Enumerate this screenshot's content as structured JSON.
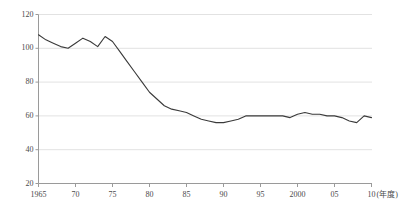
{
  "chart_data": {
    "type": "line",
    "title": "",
    "xlabel": "(年度)",
    "ylabel": "",
    "xlim": [
      1965,
      2010
    ],
    "ylim": [
      20,
      120
    ],
    "grid": true,
    "legend": false,
    "axis_color": "#9a9a9a",
    "grid_color": "#e2e2e2",
    "line_color": "#3a3a3a",
    "y_ticks": [
      {
        "value": 120,
        "label": "120"
      },
      {
        "value": 100,
        "label": "100"
      },
      {
        "value": 80,
        "label": "80"
      },
      {
        "value": 60,
        "label": "60"
      },
      {
        "value": 40,
        "label": "40"
      },
      {
        "value": 20,
        "label": "20"
      }
    ],
    "x_ticks": [
      {
        "value": 1965,
        "label": "1965"
      },
      {
        "value": 1970,
        "label": "70"
      },
      {
        "value": 1975,
        "label": "75"
      },
      {
        "value": 1980,
        "label": "80"
      },
      {
        "value": 1985,
        "label": "85"
      },
      {
        "value": 1990,
        "label": "90"
      },
      {
        "value": 1995,
        "label": "95"
      },
      {
        "value": 2000,
        "label": "2000"
      },
      {
        "value": 2005,
        "label": "05"
      },
      {
        "value": 2010,
        "label": "10"
      }
    ],
    "x_unit": "(年度)",
    "series": [
      {
        "name": "series-1",
        "x": [
          1965,
          1966,
          1967,
          1968,
          1969,
          1970,
          1971,
          1972,
          1973,
          1974,
          1975,
          1976,
          1977,
          1978,
          1979,
          1980,
          1981,
          1982,
          1983,
          1984,
          1985,
          1986,
          1987,
          1988,
          1989,
          1990,
          1991,
          1992,
          1993,
          1994,
          1995,
          1996,
          1997,
          1998,
          1999,
          2000,
          2001,
          2002,
          2003,
          2004,
          2005,
          2006,
          2007,
          2008,
          2009,
          2010
        ],
        "values": [
          108,
          105,
          103,
          101,
          100,
          103,
          106,
          104,
          101,
          107,
          104,
          98,
          92,
          86,
          80,
          74,
          70,
          66,
          64,
          63,
          62,
          60,
          58,
          57,
          56,
          56,
          57,
          58,
          60,
          60,
          60,
          60,
          60,
          60,
          59,
          61,
          62,
          61,
          61,
          60,
          60,
          59,
          57,
          56,
          60,
          59
        ]
      }
    ]
  }
}
